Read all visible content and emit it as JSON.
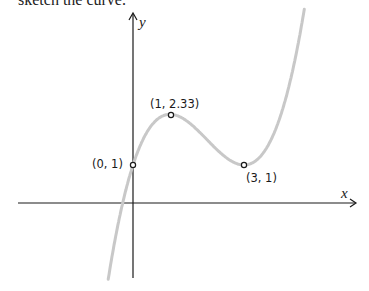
{
  "header": {
    "text": "sketch the curve."
  },
  "chart_data": {
    "type": "line",
    "title": "",
    "function": "y = x^3/3 - 2x^2 + 3x + 1",
    "xlabel": "x",
    "ylabel": "y",
    "grid": false,
    "legend": "none",
    "xlim": [
      -0.8,
      6.3
    ],
    "ylim": [
      -2.0,
      5.3
    ],
    "points": [
      {
        "x": 0,
        "y": 1,
        "label": "(0, 1)"
      },
      {
        "x": 1,
        "y": 2.33,
        "label": "(1, 2.33)"
      },
      {
        "x": 3,
        "y": 1,
        "label": "(3, 1)"
      }
    ],
    "curve_color": "#c8c8c8",
    "axis_color": "#1a1a1a"
  },
  "labels": {
    "p0": "(0, 1)",
    "p1": "(1, 2.33)",
    "p2": "(3, 1)",
    "x_axis": "x",
    "y_axis": "y"
  }
}
